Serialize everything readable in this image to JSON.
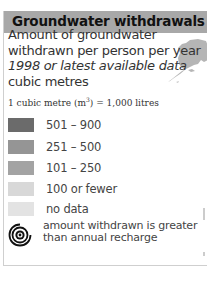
{
  "legend": {
    "title": "Groundwater withdrawals",
    "subtitle": {
      "line1": "Amount of groundwater",
      "line2": "withdrawn per person per year",
      "line3_italic": "1998 or latest available data",
      "line4": "cubic metres"
    },
    "unit_note": {
      "prefix": "1 cubic metre (m",
      "superscript": "3",
      "suffix": ") = 1,000 litres"
    },
    "classes": [
      {
        "label": "501 – 900",
        "color": "#6b6b6b"
      },
      {
        "label": "251 – 500",
        "color": "#959595"
      },
      {
        "label": "101 – 250",
        "color": "#a3a3a3"
      },
      {
        "label": "100 or fewer",
        "color": "#d8d8d8"
      },
      {
        "label": "no data",
        "color": "#e3e3e3"
      }
    ],
    "symbol": {
      "icon": "spiral-icon",
      "line1": "amount withdrawn is greater",
      "line2": "than annual recharge"
    }
  },
  "colors": {
    "header_bg": "#a8a8a8",
    "header_text": "#111111",
    "border": "#cfcfcf",
    "map_land": "#b5b5b5"
  }
}
